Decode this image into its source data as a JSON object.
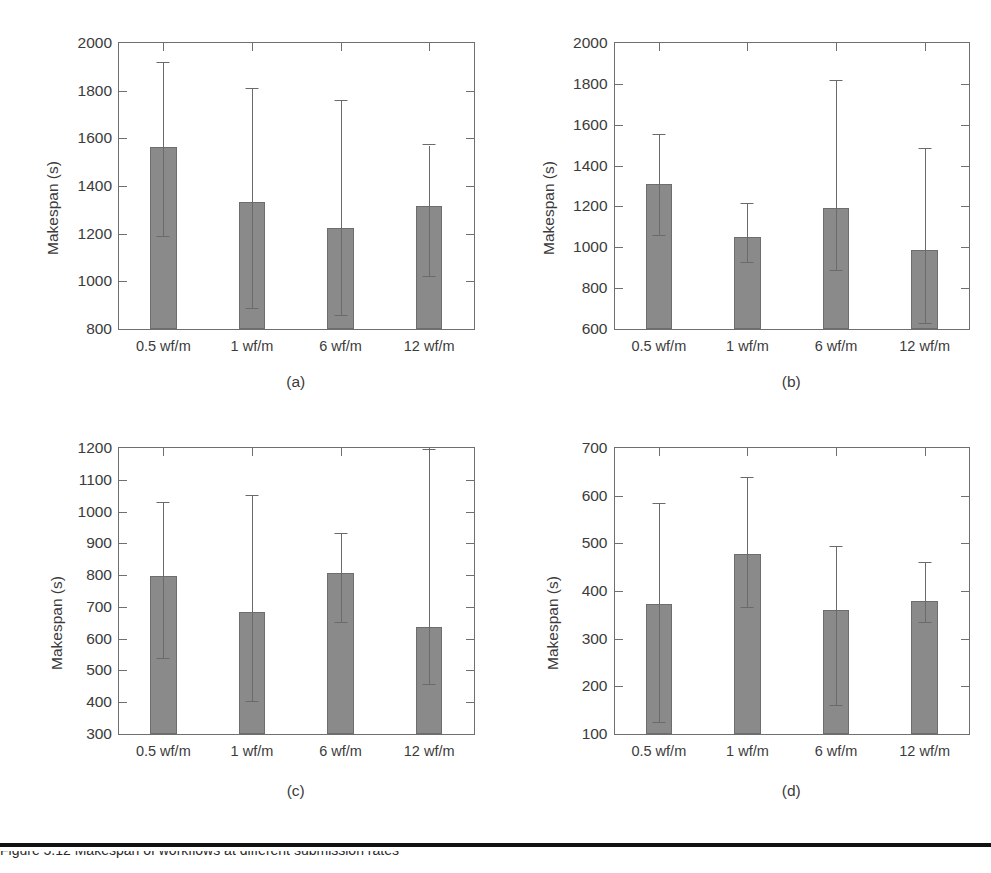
{
  "figure": {
    "ylabel": "Makespan (s)",
    "xcategories": [
      "0.5 wf/m",
      "1 wf/m",
      "6 wf/m",
      "12 wf/m"
    ],
    "bar_color": "#8a8a8a",
    "axis_color": "#6f6f6f",
    "bottom_caption": "Figure 5.12 Makespan of workflows at different submission rates"
  },
  "chart_data": [
    {
      "type": "bar",
      "panel": "(a)",
      "title": "",
      "xlabel": "",
      "ylabel": "Makespan (s)",
      "ylim": [
        800,
        2000
      ],
      "yticks": [
        800,
        1000,
        1200,
        1400,
        1600,
        1800,
        2000
      ],
      "grid": false,
      "legend": "none",
      "categories": [
        "0.5 wf/m",
        "1 wf/m",
        "6 wf/m",
        "12 wf/m"
      ],
      "values": [
        1565,
        1335,
        1225,
        1315
      ],
      "error_low": [
        1185,
        885,
        855,
        1020
      ],
      "error_high": [
        1915,
        1805,
        1755,
        1570
      ]
    },
    {
      "type": "bar",
      "panel": "(b)",
      "title": "",
      "xlabel": "",
      "ylabel": "Makespan (s)",
      "ylim": [
        600,
        2000
      ],
      "yticks": [
        600,
        800,
        1000,
        1200,
        1400,
        1600,
        1800,
        2000
      ],
      "grid": false,
      "legend": "none",
      "categories": [
        "0.5 wf/m",
        "1 wf/m",
        "6 wf/m",
        "12 wf/m"
      ],
      "values": [
        1310,
        1050,
        1190,
        985
      ],
      "error_low": [
        1055,
        925,
        885,
        625
      ],
      "error_high": [
        1550,
        1210,
        1815,
        1480
      ]
    },
    {
      "type": "bar",
      "panel": "(c)",
      "title": "",
      "xlabel": "",
      "ylabel": "Makespan (s)",
      "ylim": [
        300,
        1200
      ],
      "yticks": [
        300,
        400,
        500,
        600,
        700,
        800,
        900,
        1000,
        1100,
        1200
      ],
      "grid": false,
      "legend": "none",
      "categories": [
        "0.5 wf/m",
        "1 wf/m",
        "6 wf/m",
        "12 wf/m"
      ],
      "values": [
        798,
        685,
        808,
        638
      ],
      "error_low": [
        537,
        400,
        650,
        455
      ],
      "error_high": [
        1027,
        1050,
        930,
        1193
      ]
    },
    {
      "type": "bar",
      "panel": "(d)",
      "title": "",
      "xlabel": "",
      "ylabel": "Makespan (s)",
      "ylim": [
        100,
        700
      ],
      "yticks": [
        100,
        200,
        300,
        400,
        500,
        600,
        700
      ],
      "grid": false,
      "legend": "none",
      "categories": [
        "0.5 wf/m",
        "1 wf/m",
        "6 wf/m",
        "12 wf/m"
      ],
      "values": [
        372,
        478,
        360,
        379
      ],
      "error_low": [
        124,
        365,
        158,
        333
      ],
      "error_high": [
        583,
        638,
        492,
        458
      ]
    }
  ]
}
